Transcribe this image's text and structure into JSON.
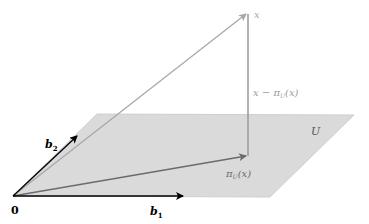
{
  "diagram": {
    "labels": {
      "origin": "0",
      "b1": "b",
      "b1_sub": "1",
      "b2": "b",
      "b2_sub": "2",
      "x": "x",
      "residual": "x − π",
      "residual_sub": "U",
      "residual_tail": "(x)",
      "projection": "π",
      "projection_sub": "U",
      "projection_tail": "(x)",
      "subspace": "U"
    },
    "colors": {
      "plane_fill": "#d9d9d9",
      "plane_edge": "#c8c8c8",
      "basis_vector": "#000000",
      "x_vector": "#a8a8a8",
      "residual_vector": "#999999",
      "projection_vector": "#6b6b6b",
      "gray_label": "#9a9a9a",
      "dark_label": "#000000"
    }
  }
}
